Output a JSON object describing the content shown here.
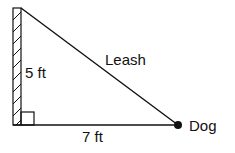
{
  "diagram": {
    "wall_label": "5 ft",
    "ground_label": "7 ft",
    "hypotenuse_label": "Leash",
    "endpoint_label": "Dog",
    "colors": {
      "stroke": "#111111",
      "background": "#ffffff"
    }
  }
}
